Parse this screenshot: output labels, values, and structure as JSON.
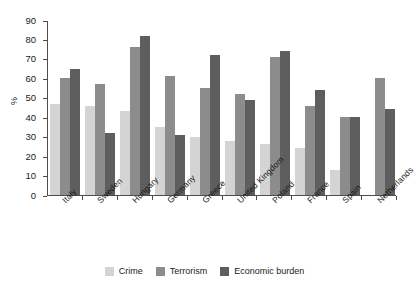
{
  "chart_data": {
    "type": "bar",
    "title": "",
    "subtitle": "",
    "xlabel": "",
    "ylabel": "%",
    "ylim": [
      0,
      90
    ],
    "ytick_step": 10,
    "yticks": [
      "90",
      "80",
      "70",
      "60",
      "50",
      "40",
      "30",
      "20",
      "10",
      "0"
    ],
    "grid": false,
    "legend_position": "bottom",
    "categories": [
      "Italy",
      "Sweden",
      "Hungary",
      "Germany",
      "Greece",
      "United Kingdom",
      "Poland",
      "France",
      "Spain",
      "Netherlands"
    ],
    "series": [
      {
        "name": "Crime",
        "color": "#d4d4d4",
        "values": [
          47,
          46,
          43,
          35,
          30,
          28,
          26,
          24,
          13,
          0
        ]
      },
      {
        "name": "Terrorism",
        "color": "#8c8c8c",
        "values": [
          60,
          57,
          76,
          61,
          55,
          52,
          71,
          46,
          40,
          60
        ]
      },
      {
        "name": "Economic burden",
        "color": "#5e5e5e",
        "values": [
          65,
          32,
          82,
          31,
          72,
          49,
          74,
          54,
          40,
          44
        ]
      }
    ]
  },
  "legend": {
    "items": [
      {
        "label": "Crime"
      },
      {
        "label": "Terrorism"
      },
      {
        "label": "Economic burden"
      }
    ]
  }
}
